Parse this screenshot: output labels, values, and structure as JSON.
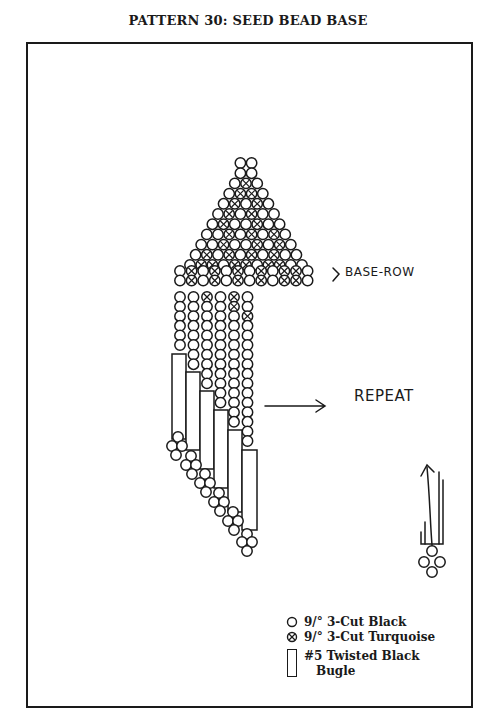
{
  "title": "PATTERN 30:  SEED BEAD BASE",
  "labels": {
    "base_row": "BASE-ROW",
    "repeat": "REPEAT"
  },
  "legend": [
    {
      "symbol": "plain-bead",
      "label": "9/° 3-Cut Black"
    },
    {
      "symbol": "x-bead",
      "label": "9/° 3-Cut Turquoise"
    },
    {
      "symbol": "bugle",
      "label_line1": "#5 Twisted Black",
      "label_line2": "Bugle"
    }
  ],
  "colors": {
    "ink": "#1a1a1a",
    "paper": "#ffffff"
  },
  "pattern": {
    "triangle_rows": [
      "OO",
      "OO",
      "OXO",
      "OXXO",
      "OXOXO",
      "OXOXOO",
      "OXOOXOO",
      "OOXOXOXO",
      "OOXOOXOXO",
      "OXOXOXOXOO",
      "OXXOXXOXXOO"
    ],
    "base_row": "OXOXOXOXOXXO",
    "fringe_strands": 6,
    "bugle_count": 6
  }
}
